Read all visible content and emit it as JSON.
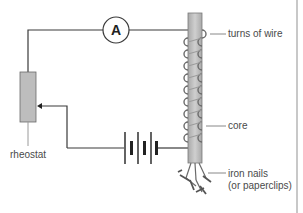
{
  "diagram": {
    "ammeter": {
      "symbol": "A"
    },
    "labels": {
      "turns_of_wire": "turns of wire",
      "core": "core",
      "iron_nails_line1": "iron nails",
      "iron_nails_line2": "(or paperclips)",
      "rheostat": "rheostat"
    },
    "components": [
      "ammeter",
      "rheostat",
      "battery",
      "coil",
      "core",
      "iron nails"
    ],
    "coil_turns": 9,
    "battery_cells": 2,
    "colors": {
      "wire": "#3a3a3a",
      "core_fill": "#b8b8b8",
      "rheostat_fill": "#bdbdbd",
      "label_text": "#4a4a4a",
      "border": "#c8c8c8"
    }
  }
}
